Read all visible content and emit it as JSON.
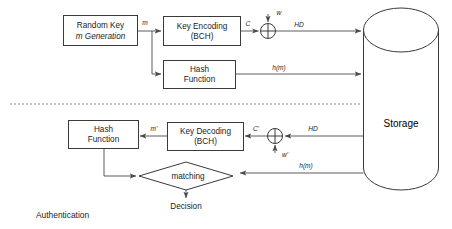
{
  "diagram": {
    "title_label": "Authentication",
    "nodes": {
      "random_key": {
        "line1": "Random Key",
        "line2": "m Generation"
      },
      "key_encoding": {
        "line1": "Key Encoding",
        "line2": "(BCH)"
      },
      "hash_enroll": {
        "line1": "Hash",
        "line2": "Function"
      },
      "key_decoding": {
        "line1": "Key Decoding",
        "line2": "(BCH)"
      },
      "hash_auth": {
        "line1": "Hash",
        "line2": "Function"
      },
      "matching": {
        "label": "matching"
      },
      "decision": {
        "label": "Decision"
      },
      "storage": {
        "label": "Storage"
      },
      "xor_enroll": {
        "symbol": "xor-gate"
      },
      "xor_auth": {
        "symbol": "xor-gate"
      }
    },
    "edge_labels": {
      "m": "m",
      "c": "C",
      "w": "w",
      "hd_enroll": "HD",
      "hm_enroll": "h(m)",
      "hd_auth": "HD",
      "w_prime": "w'",
      "c_prime": "C'",
      "m_prime": "m'",
      "hm_auth": "h(m)"
    },
    "colors": {
      "background": "#ffffff",
      "stroke": "#3a3a3a",
      "connector": "#4a4a4a",
      "text": "#1c1c1c",
      "divider": "#7a7a7a"
    }
  }
}
